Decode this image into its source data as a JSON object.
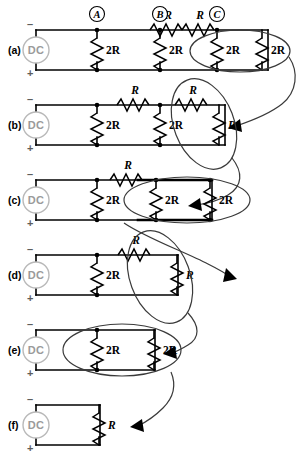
{
  "figure": {
    "background_color": "#ffffff",
    "line_color": "#000000",
    "source_color": "#9a9a9a",
    "highlight_color": "#3a3a3a"
  },
  "node_labels": [
    {
      "id": "A",
      "text": "A"
    },
    {
      "id": "B",
      "text": "B"
    },
    {
      "id": "C",
      "text": "C"
    }
  ],
  "source": {
    "label": "DC",
    "minus": "–",
    "plus": "+"
  },
  "rows": [
    {
      "id": "a",
      "label": "(a)",
      "series_resistors": [
        {
          "label": "R"
        },
        {
          "label": "R"
        }
      ],
      "shunt_resistors": [
        {
          "label": "2R"
        },
        {
          "label": "2R"
        },
        {
          "label": "2R"
        },
        {
          "label": "2R"
        }
      ],
      "highlight_caption": "2R parallel 2R"
    },
    {
      "id": "b",
      "label": "(b)",
      "series_resistors": [
        {
          "label": "R"
        },
        {
          "label": "R"
        }
      ],
      "shunt_resistors": [
        {
          "label": "2R"
        },
        {
          "label": "2R"
        },
        {
          "label": "R"
        }
      ],
      "highlight_caption": "R series R = 2R"
    },
    {
      "id": "c",
      "label": "(c)",
      "series_resistors": [
        {
          "label": "R"
        }
      ],
      "shunt_resistors": [
        {
          "label": "2R"
        },
        {
          "label": "2R"
        },
        {
          "label": "2R"
        }
      ],
      "highlight_caption": "2R parallel 2R"
    },
    {
      "id": "d",
      "label": "(d)",
      "series_resistors": [
        {
          "label": "R"
        }
      ],
      "shunt_resistors": [
        {
          "label": "2R"
        },
        {
          "label": "R"
        }
      ],
      "highlight_caption": "R series R = 2R"
    },
    {
      "id": "e",
      "label": "(e)",
      "series_resistors": [],
      "shunt_resistors": [
        {
          "label": "2R"
        },
        {
          "label": "2R"
        }
      ],
      "highlight_caption": "2R parallel 2R = R"
    },
    {
      "id": "f",
      "label": "(f)",
      "series_resistors": [],
      "shunt_resistors": [
        {
          "label": "R"
        }
      ],
      "highlight_caption": ""
    }
  ]
}
